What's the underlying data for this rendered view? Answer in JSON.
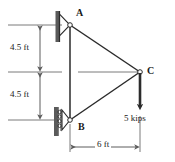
{
  "figure": {
    "type": "statics-truss-free-body-diagram",
    "colors": {
      "line": "#2b2b2b",
      "wall": "#4a4a4a",
      "dimension": "#6b6b6b",
      "text": "#1a1a1a",
      "background": "#ffffff"
    }
  },
  "joints": [
    {
      "id": "A",
      "label": "A",
      "x": 70,
      "y": 25,
      "support": "pin",
      "label_dx": 6,
      "label_dy": -15
    },
    {
      "id": "B",
      "label": "B",
      "x": 70,
      "y": 120,
      "support": "rocker-roller",
      "label_dx": 7,
      "label_dy": 3
    },
    {
      "id": "C",
      "label": "C",
      "x": 140,
      "y": 72,
      "support": "none",
      "label_dx": 7,
      "label_dy": -6
    }
  ],
  "members": [
    {
      "from": "A",
      "to": "C"
    },
    {
      "from": "B",
      "to": "C"
    },
    {
      "from": "A",
      "to": "B"
    }
  ],
  "load": {
    "label": "5 kips",
    "magnitude": 5,
    "unit": "kips",
    "direction": "down",
    "applied_at": "C",
    "tail_x": 140,
    "tail_y": 72,
    "tip_x": 140,
    "tip_y": 113,
    "label_x": 124,
    "label_y": 117
  },
  "dimensions": [
    {
      "id": "vertical-upper",
      "label": "4.5 ft",
      "value": 4.5,
      "unit": "ft",
      "orientation": "vertical",
      "from_y": 25,
      "to_y": 72,
      "line_x": 40,
      "label_x": 10,
      "label_y": 44
    },
    {
      "id": "vertical-lower",
      "label": "4.5 ft",
      "value": 4.5,
      "unit": "ft",
      "orientation": "vertical",
      "from_y": 72,
      "to_y": 120,
      "line_x": 40,
      "label_x": 10,
      "label_y": 92
    },
    {
      "id": "horizontal-span",
      "label": "6 ft",
      "value": 6,
      "unit": "ft",
      "orientation": "horizontal",
      "from_x": 70,
      "to_x": 140,
      "line_y": 147,
      "label_x": 95,
      "label_y": 141
    }
  ],
  "extension_lines": [
    {
      "id": "ext-top",
      "y": 25,
      "x1": 8,
      "x2": 62
    },
    {
      "id": "ext-middle",
      "y": 72,
      "x1": 8,
      "x2": 138
    },
    {
      "id": "ext-bottom",
      "y": 120,
      "x1": 8,
      "x2": 58
    }
  ],
  "walls": [
    {
      "id": "wall-top",
      "x": 57,
      "y1": 11,
      "y2": 42
    },
    {
      "id": "wall-bottom",
      "x": 55,
      "y1": 107,
      "y2": 136
    }
  ]
}
